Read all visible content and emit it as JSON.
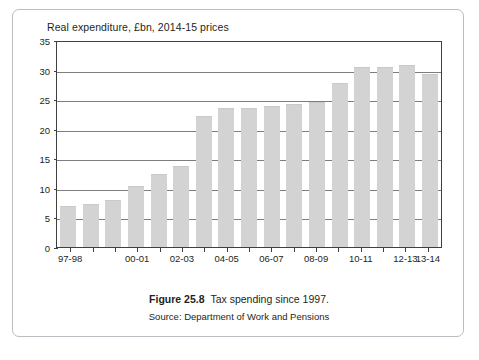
{
  "figure": {
    "caption_label": "Figure 25.8",
    "caption_text": "Tax spending since 1997.",
    "source": "Source: Department of Work and Pensions"
  },
  "chart_data": {
    "type": "bar",
    "title": "Real expenditure, £bn, 2014-15 prices",
    "xlabel": "",
    "ylabel": "",
    "ylim": [
      0,
      35
    ],
    "ytick_values": [
      0,
      5,
      10,
      15,
      20,
      25,
      30,
      35
    ],
    "ytick_labels": [
      "0",
      "5",
      "10",
      "15",
      "20",
      "25",
      "30",
      "35"
    ],
    "grid": true,
    "legend": "none",
    "bar_color": "#d3d3d3",
    "categories": [
      "97-98",
      "98-99",
      "99-00",
      "00-01",
      "01-02",
      "02-03",
      "03-04",
      "04-05",
      "05-06",
      "06-07",
      "07-08",
      "08-09",
      "09-10",
      "10-11",
      "11-12",
      "12-13",
      "13-14"
    ],
    "values": [
      7.0,
      7.2,
      8.0,
      10.3,
      12.3,
      13.7,
      22.2,
      23.5,
      23.5,
      23.8,
      24.2,
      24.5,
      27.8,
      30.5,
      30.5,
      30.8,
      29.2
    ],
    "visible_xtick_labels": [
      {
        "label": "97-98",
        "index": 0
      },
      {
        "label": "00-01",
        "index": 3
      },
      {
        "label": "02-03",
        "index": 5
      },
      {
        "label": "04-05",
        "index": 7
      },
      {
        "label": "06-07",
        "index": 9
      },
      {
        "label": "08-09",
        "index": 11
      },
      {
        "label": "10-11",
        "index": 13
      },
      {
        "label": "12-13",
        "index": 15
      },
      {
        "label": "13-14",
        "index": 16
      }
    ]
  }
}
